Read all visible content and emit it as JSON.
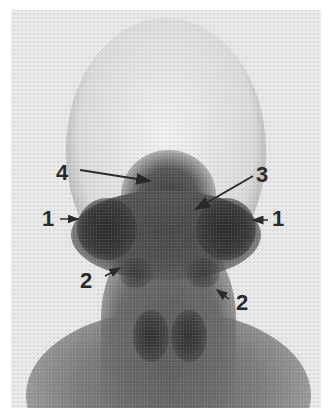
{
  "figure": {
    "background_color": "#e9e9e9",
    "labels": [
      {
        "id": "label-4-left",
        "text": "4",
        "x": 56,
        "y": 162
      },
      {
        "id": "label-3-right",
        "text": "3",
        "x": 256,
        "y": 164
      },
      {
        "id": "label-1-left",
        "text": "1",
        "x": 42,
        "y": 208
      },
      {
        "id": "label-1-right",
        "text": "1",
        "x": 272,
        "y": 208
      },
      {
        "id": "label-2-left",
        "text": "2",
        "x": 80,
        "y": 270
      },
      {
        "id": "label-2-right",
        "text": "2",
        "x": 236,
        "y": 292
      }
    ],
    "arrows": [
      {
        "id": "arrow-4",
        "from": [
          80,
          170
        ],
        "to": [
          150,
          181
        ]
      },
      {
        "id": "arrow-3",
        "from": [
          253,
          176
        ],
        "to": [
          196,
          209
        ]
      },
      {
        "id": "arrow-1-left",
        "from": [
          60,
          219
        ],
        "to": [
          78,
          219
        ]
      },
      {
        "id": "arrow-1-right",
        "from": [
          268,
          220
        ],
        "to": [
          253,
          220
        ]
      },
      {
        "id": "arrow-2-left",
        "from": [
          105,
          276
        ],
        "to": [
          120,
          268
        ]
      },
      {
        "id": "arrow-2-right",
        "from": [
          229,
          299
        ],
        "to": [
          217,
          290
        ]
      }
    ]
  }
}
